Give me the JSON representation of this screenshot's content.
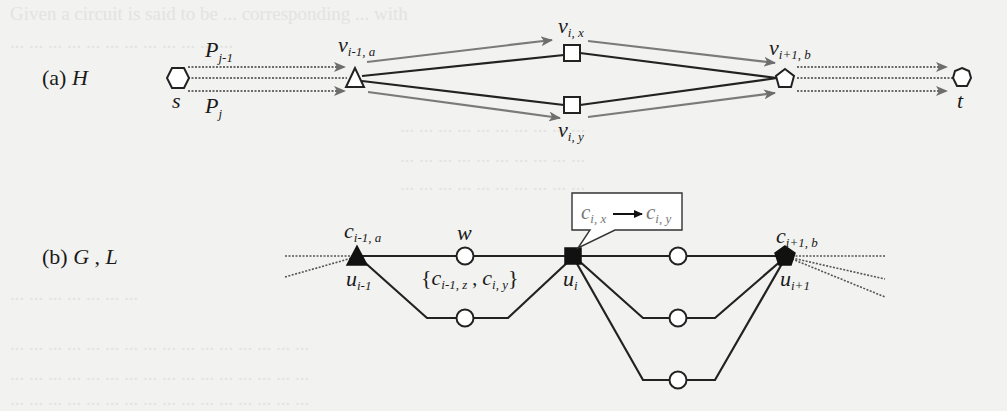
{
  "figure": {
    "background": "#f2f2f0",
    "colors": {
      "edge_dark": "#222222",
      "edge_path_gray": "#7a7a7a",
      "arrow_gray": "#707070",
      "dotted": "#555555",
      "node_fill_black": "#111111",
      "node_fill_white": "#ffffff"
    },
    "panel_a": {
      "label_prefix": "(a) ",
      "label_var": "H",
      "source": {
        "name": "s",
        "shape": "hexagon"
      },
      "sink": {
        "name": "t",
        "shape": "heptagon"
      },
      "path_labels": [
        {
          "base": "P",
          "sub": "j-1"
        },
        {
          "base": "P",
          "sub": "j"
        }
      ],
      "nodes": [
        {
          "base": "v",
          "sub": "i-1, a",
          "shape": "triangle"
        },
        {
          "base": "v",
          "sub": "i, x",
          "shape": "square"
        },
        {
          "base": "v",
          "sub": "i, y",
          "shape": "square"
        },
        {
          "base": "v",
          "sub": "i+1, b",
          "shape": "pentagon"
        }
      ]
    },
    "panel_b": {
      "label_prefix": "(b) ",
      "label_var1": "G",
      "label_sep": " , ",
      "label_var2": "L",
      "nodes": [
        {
          "base": "u",
          "sub": "i-1",
          "top_base": "c",
          "top_sub": "i-1, a",
          "shape": "filled-triangle"
        },
        {
          "base": "u",
          "sub": "i",
          "shape": "filled-square"
        },
        {
          "base": "u",
          "sub": "i+1",
          "top_base": "c",
          "top_sub": "i+1, b",
          "shape": "filled-pentagon"
        }
      ],
      "w_label": "w",
      "set_label": {
        "open": "{",
        "c1_base": "c",
        "c1_sub": "i-1, z",
        "sep": " , ",
        "c2_base": "c",
        "c2_sub": "i, y",
        "close": "}"
      },
      "callout": {
        "from_base": "c",
        "from_sub": "i, x",
        "to_base": "c",
        "to_sub": "i, y",
        "arrow": "→"
      }
    }
  }
}
